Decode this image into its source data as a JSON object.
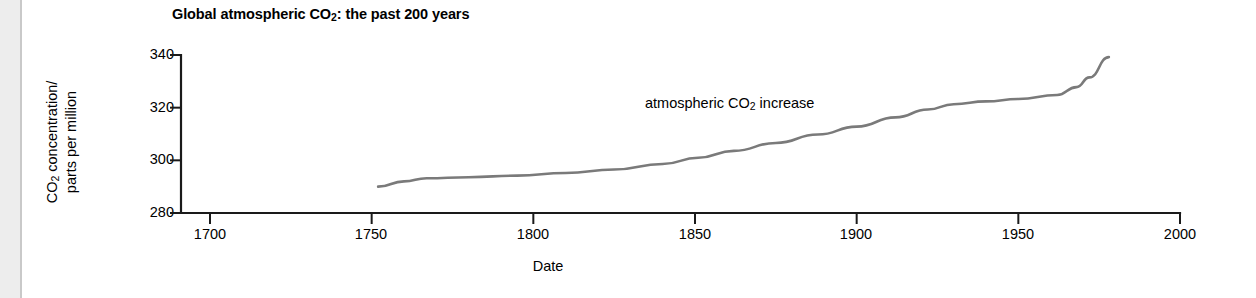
{
  "chart_data": {
    "type": "line",
    "title": "Global atmospheric CO2: the past 200 years",
    "title_parts": {
      "pre": "Global atmospheric CO",
      "sub": "2",
      "post": ": the past 200 years"
    },
    "xlabel": "Date",
    "ylabel": "CO2 concentration/parts per million",
    "ylabel_parts": {
      "line1_pre": "CO",
      "line1_sub": "2",
      "line1_post": " concentration/",
      "line2": "parts per million"
    },
    "xlim": [
      1700,
      2000
    ],
    "ylim": [
      280,
      340
    ],
    "xticks": [
      1700,
      1750,
      1800,
      1850,
      1900,
      1950,
      2000
    ],
    "xtick_labels": [
      "1700",
      "1750",
      "1800",
      "1850",
      "1900",
      "1950",
      "2000"
    ],
    "yticks": [
      280,
      300,
      320,
      340
    ],
    "ytick_labels": [
      "280",
      "300",
      "320",
      "340"
    ],
    "grid": false,
    "legend": "none",
    "line_color": "#7a7a7a",
    "axis_color": "#1a1a1a",
    "annotations": [
      {
        "text": "atmospheric CO2 increase",
        "pre": "atmospheric CO",
        "sub": "2",
        "post": " increase",
        "x": 1845,
        "y": 322
      }
    ],
    "series": [
      {
        "name": "atmospheric CO2 increase",
        "x": [
          1752,
          1760,
          1767,
          1780,
          1795,
          1810,
          1825,
          1840,
          1851,
          1862,
          1875,
          1888,
          1900,
          1912,
          1922,
          1930,
          1940,
          1950,
          1962,
          1968,
          1972,
          1978
        ],
        "y": [
          290.0,
          292.0,
          293.2,
          293.6,
          294.2,
          295.2,
          296.5,
          298.6,
          301.0,
          303.6,
          306.6,
          309.8,
          312.8,
          316.3,
          319.3,
          321.3,
          322.4,
          323.3,
          324.8,
          327.8,
          331.5,
          339.2
        ]
      }
    ]
  }
}
